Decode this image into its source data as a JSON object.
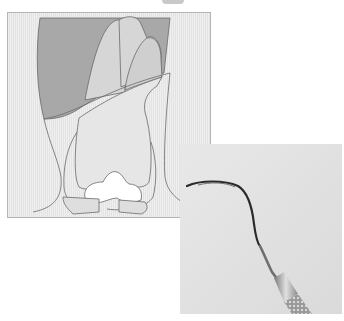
{
  "figure": {
    "illustration": {
      "subject": "tooth-cross-section-with-gingiva",
      "regions": [
        "gingiva",
        "tooth-crown",
        "tooth-roots",
        "interproximal-papilla",
        "bone"
      ],
      "colors": {
        "frame_border": "#b5b5b5",
        "background_stipple": "#ececec",
        "gingiva_dark": "#a8a8a8",
        "root_light": "#d6d6d6",
        "tooth_body": "#e6e6e6",
        "outline": "#6a6a6a"
      }
    },
    "photo": {
      "subject": "dental-curette-instrument",
      "colors": {
        "background": "#e4e4e4",
        "instrument_tip": "#2a2a2a",
        "shank": "#6e6e6e",
        "handle": "#9a9a9a"
      }
    }
  }
}
